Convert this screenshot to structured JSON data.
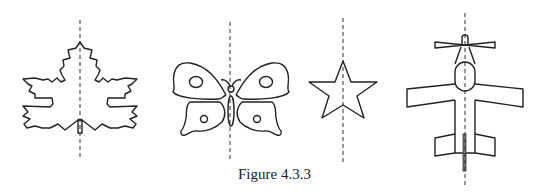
{
  "figure": {
    "caption": "Figure 4.3.3",
    "shapes": [
      {
        "name": "maple-leaf",
        "has_symmetry_axis": true
      },
      {
        "name": "butterfly",
        "has_symmetry_axis": true
      },
      {
        "name": "star",
        "has_symmetry_axis": true
      },
      {
        "name": "airplane",
        "has_symmetry_axis": true
      }
    ],
    "line_color": "#222222",
    "axis_style": "dashed vertical"
  }
}
